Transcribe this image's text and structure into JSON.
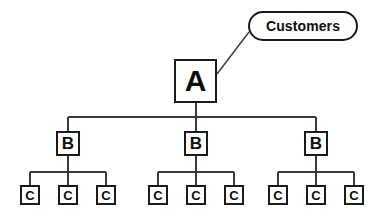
{
  "diagram": {
    "type": "hierarchy-tree",
    "background_color": "#ffffff",
    "line_color": "#3a3a3a",
    "border_color": "#1a1a1a",
    "text_color": "#0d0d0d",
    "callout": {
      "label": "Customers",
      "shape": "rounded-pill",
      "x": 248,
      "y": 11,
      "width": 110,
      "height": 30
    },
    "levels": [
      {
        "name": "level-a",
        "nodes": [
          {
            "label": "A",
            "x": 174,
            "y": 59
          }
        ]
      },
      {
        "name": "level-b",
        "nodes": [
          {
            "label": "B",
            "x": 56,
            "y": 131
          },
          {
            "label": "B",
            "x": 184,
            "y": 131
          },
          {
            "label": "B",
            "x": 304,
            "y": 131
          }
        ]
      },
      {
        "name": "level-c",
        "nodes": [
          {
            "label": "C",
            "x": 20,
            "y": 185
          },
          {
            "label": "C",
            "x": 58,
            "y": 185
          },
          {
            "label": "C",
            "x": 96,
            "y": 185
          },
          {
            "label": "C",
            "x": 148,
            "y": 185
          },
          {
            "label": "C",
            "x": 186,
            "y": 185
          },
          {
            "label": "C",
            "x": 224,
            "y": 185
          },
          {
            "label": "C",
            "x": 268,
            "y": 185
          },
          {
            "label": "C",
            "x": 306,
            "y": 185
          },
          {
            "label": "C",
            "x": 344,
            "y": 185
          }
        ]
      }
    ],
    "connectors": {
      "callout_leader": {
        "from_x": 217,
        "from_y": 74,
        "to_x": 249,
        "to_y": 32
      },
      "a_stem": {
        "x": 196,
        "from_y": 103,
        "to_y": 117
      },
      "b_bus": {
        "y": 117,
        "from_x": 68,
        "to_x": 316
      },
      "b_drops": [
        {
          "x": 68,
          "from_y": 117,
          "to_y": 131
        },
        {
          "x": 196,
          "from_y": 117,
          "to_y": 131
        },
        {
          "x": 316,
          "from_y": 117,
          "to_y": 131
        }
      ],
      "b_stems": [
        {
          "x": 68,
          "from_y": 156,
          "to_y": 172
        },
        {
          "x": 196,
          "from_y": 156,
          "to_y": 172
        },
        {
          "x": 316,
          "from_y": 156,
          "to_y": 172
        }
      ],
      "c_buses": [
        {
          "y": 172,
          "from_x": 30,
          "to_x": 106
        },
        {
          "y": 172,
          "from_x": 158,
          "to_x": 234
        },
        {
          "y": 172,
          "from_x": 278,
          "to_x": 354
        }
      ],
      "c_drops": [
        {
          "x": 30,
          "from_y": 172,
          "to_y": 185
        },
        {
          "x": 68,
          "from_y": 172,
          "to_y": 185
        },
        {
          "x": 106,
          "from_y": 172,
          "to_y": 185
        },
        {
          "x": 158,
          "from_y": 172,
          "to_y": 185
        },
        {
          "x": 196,
          "from_y": 172,
          "to_y": 185
        },
        {
          "x": 234,
          "from_y": 172,
          "to_y": 185
        },
        {
          "x": 278,
          "from_y": 172,
          "to_y": 185
        },
        {
          "x": 316,
          "from_y": 172,
          "to_y": 185
        },
        {
          "x": 354,
          "from_y": 172,
          "to_y": 185
        }
      ]
    }
  }
}
